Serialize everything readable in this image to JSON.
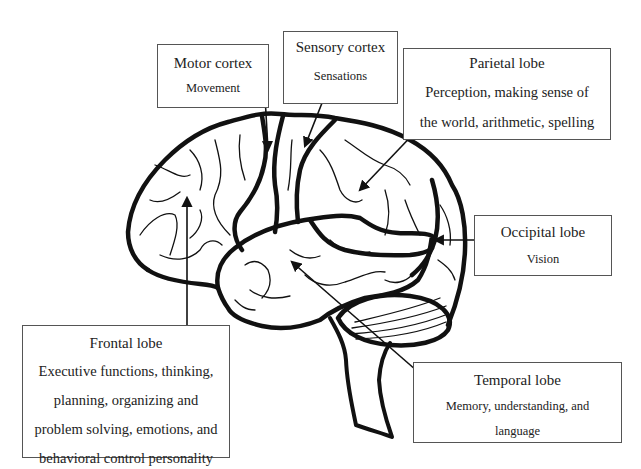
{
  "diagram": {
    "labels": [
      {
        "id": "motor",
        "title": "Motor cortex",
        "description": "Movement"
      },
      {
        "id": "sensory",
        "title": "Sensory cortex",
        "description": "Sensations"
      },
      {
        "id": "parietal",
        "title": "Parietal lobe",
        "description": "Perception, making sense of the world, arithmetic, spelling",
        "lines": [
          "Perception, making sense of",
          "the world, arithmetic, spelling"
        ]
      },
      {
        "id": "occipital",
        "title": "Occipital lobe",
        "description": "Vision"
      },
      {
        "id": "frontal",
        "title": "Frontal lobe",
        "description": "Executive functions, thinking, planning, organizing and problem solving, emotions, and behavioral control personality",
        "lines": [
          "Executive functions, thinking,",
          "planning, organizing and",
          "problem solving, emotions, and",
          "behavioral control personality"
        ]
      },
      {
        "id": "temporal",
        "title": "Temporal lobe",
        "description": "Memory, understanding, and language",
        "lines": [
          "Memory, understanding, and",
          "language"
        ]
      }
    ],
    "colors": {
      "ink": "#1a1a1a",
      "box_border": "#555555",
      "background": "#ffffff"
    }
  }
}
